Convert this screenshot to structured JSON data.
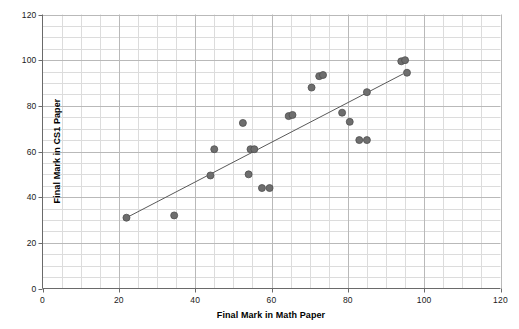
{
  "chart_data": {
    "type": "scatter",
    "title": "",
    "xlabel": "Final Mark in Math Paper",
    "ylabel": "Final Mark in CS1 Paper",
    "xlim": [
      0,
      120
    ],
    "ylim": [
      0,
      120
    ],
    "x_ticks": [
      0,
      20,
      40,
      60,
      80,
      100,
      120
    ],
    "y_ticks": [
      0,
      20,
      40,
      60,
      80,
      100,
      120
    ],
    "x_tick_labels": [
      "0",
      "20",
      "40",
      "60",
      "80",
      "100",
      "120"
    ],
    "y_tick_labels": [
      "0",
      "20",
      "40",
      "60",
      "80",
      "100",
      "120"
    ],
    "grid": true,
    "minor_grid_step": 5,
    "major_grid_step": 20,
    "legend": null,
    "marker_color": "#6e6e6e",
    "marker_edge_color": "#4f4f4f",
    "marker_size": 5,
    "grid_major_color": "#b9b9b9",
    "grid_minor_color": "#dcdcdc",
    "axis_color": "#6a6a6a",
    "trendline": {
      "color": "#595959",
      "x_start": 22,
      "y_start": 31,
      "x_end": 94.5,
      "y_end": 94
    },
    "points": [
      {
        "x": 22,
        "y": 31
      },
      {
        "x": 34.5,
        "y": 32
      },
      {
        "x": 44,
        "y": 49.5
      },
      {
        "x": 45,
        "y": 61
      },
      {
        "x": 52.5,
        "y": 72.5
      },
      {
        "x": 54.5,
        "y": 61
      },
      {
        "x": 55.5,
        "y": 61
      },
      {
        "x": 54,
        "y": 50
      },
      {
        "x": 57.5,
        "y": 44
      },
      {
        "x": 59.5,
        "y": 44
      },
      {
        "x": 64.5,
        "y": 75.5
      },
      {
        "x": 65.5,
        "y": 76
      },
      {
        "x": 70.5,
        "y": 88
      },
      {
        "x": 72.5,
        "y": 93
      },
      {
        "x": 73.5,
        "y": 93.5
      },
      {
        "x": 78.5,
        "y": 77
      },
      {
        "x": 80.5,
        "y": 73
      },
      {
        "x": 85,
        "y": 86
      },
      {
        "x": 83,
        "y": 65
      },
      {
        "x": 85,
        "y": 65
      },
      {
        "x": 94,
        "y": 99.5
      },
      {
        "x": 95,
        "y": 100
      },
      {
        "x": 95.5,
        "y": 94.5
      }
    ]
  },
  "axes": {
    "x_title": "Final Mark in Math Paper",
    "y_title": "Final Mark in CS1 Paper"
  }
}
